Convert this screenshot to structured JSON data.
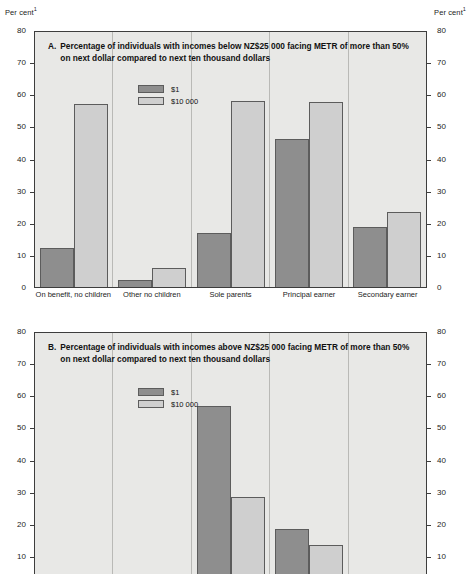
{
  "axis": {
    "unit_label": "Per cent",
    "unit_footnote": "1",
    "ticks": [
      80,
      70,
      60,
      50,
      40,
      30,
      20,
      10,
      0
    ],
    "ymin": 0,
    "ymax": 80
  },
  "legend": {
    "series": [
      {
        "key": "s1",
        "label": "$1",
        "color": "#8e8e8e"
      },
      {
        "key": "s10k",
        "label": "$10 000",
        "color": "#cfcfcf"
      }
    ]
  },
  "panel_a": {
    "letter": "A.",
    "title": "Percentage of individuals with incomes below NZ$25 000 facing METR of more than 50% on next dollar compared to next ten thousand dollars"
  },
  "panel_b": {
    "letter": "B.",
    "title": "Percentage of individuals with incomes above NZ$25 000 facing METR of more than 50% on next dollar compared to next ten thousand dollars"
  },
  "categories": [
    "On benefit, no children",
    "Other no children",
    "Sole parents",
    "Principal earner",
    "Secondary earner"
  ],
  "chart_data": [
    {
      "type": "bar",
      "panel": "A",
      "title": "A. Percentage of individuals with incomes below NZ$25 000 facing METR of more than 50% on next dollar compared to next ten thousand dollars",
      "xlabel": "",
      "ylabel": "Per cent",
      "ylim": [
        0,
        80
      ],
      "yticks": [
        0,
        10,
        20,
        30,
        40,
        50,
        60,
        70,
        80
      ],
      "grid": false,
      "legend_position": "inside top-left",
      "categories": [
        "On benefit, no children",
        "Other no children",
        "Sole parents",
        "Principal earner",
        "Secondary earner"
      ],
      "series": [
        {
          "name": "$1",
          "values": [
            12.3,
            2.2,
            16.7,
            46.0,
            18.7
          ]
        },
        {
          "name": "$10 000",
          "values": [
            57.0,
            6.0,
            58.0,
            57.5,
            23.3
          ]
        }
      ]
    },
    {
      "type": "bar",
      "panel": "B",
      "title": "B. Percentage of individuals with incomes above NZ$25 000 facing METR of more than 50% on next dollar compared to next ten thousand dollars",
      "xlabel": "",
      "ylabel": "Per cent",
      "ylim": [
        0,
        80
      ],
      "yticks": [
        0,
        10,
        20,
        30,
        40,
        50,
        60,
        70,
        80
      ],
      "grid": false,
      "legend_position": "inside top-left",
      "note": "Panel is cut off at the bottom edge of the screenshot just below the 10 gridline; category axis labels are not visible.",
      "categories": [
        "On benefit, no children",
        "Other no children",
        "Sole parents",
        "Principal earner",
        "Secondary earner"
      ],
      "series": [
        {
          "name": "$1",
          "values": [
            0,
            0,
            56.8,
            18.5,
            0
          ]
        },
        {
          "name": "$10 000",
          "values": [
            0,
            0,
            28.3,
            13.5,
            0
          ]
        }
      ]
    }
  ]
}
